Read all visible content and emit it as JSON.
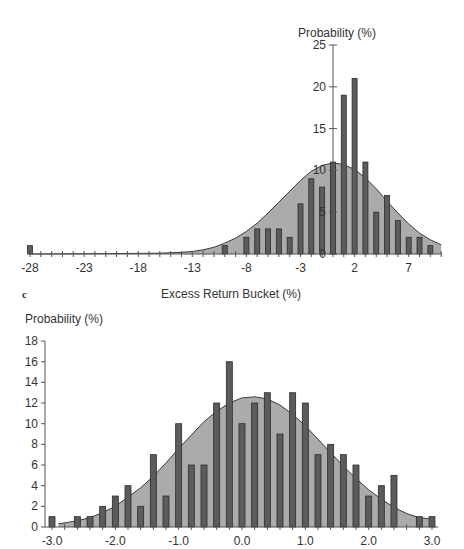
{
  "colors": {
    "background": "#ffffff",
    "bar_fill": "#5c5c5c",
    "bar_stroke": "#2a2a2a",
    "area_fill": "#ababab",
    "curve": "#3a3a3a",
    "axis": "#555555",
    "text": "#333333"
  },
  "chart_data": [
    {
      "type": "bar",
      "id": "top",
      "title": "",
      "ylabel": "Probability (%)",
      "xlabel": "Excess Return Bucket (%)",
      "ylim": [
        0,
        25
      ],
      "yticks": [
        0,
        5,
        10,
        15,
        20,
        25
      ],
      "xticks": [
        -28,
        -23,
        -18,
        -13,
        -8,
        -3,
        2,
        7
      ],
      "xlim": [
        -28,
        10
      ],
      "y_axis_at_x": 0,
      "grid": false,
      "legend": null,
      "categories": [
        -28,
        -10,
        -8,
        -7,
        -6,
        -5,
        -4,
        -3,
        -2,
        -1,
        0,
        1,
        2,
        3,
        4,
        5,
        6,
        7,
        8,
        9
      ],
      "values": [
        1,
        1,
        2,
        3,
        3,
        3,
        2,
        6,
        9,
        8,
        11,
        19,
        21,
        11,
        5,
        7,
        4,
        2,
        2,
        1
      ],
      "overlay": {
        "type": "area",
        "description": "fitted normal density",
        "x": [
          -28,
          -20,
          -16,
          -14,
          -13,
          -12,
          -11,
          -10,
          -9,
          -8,
          -7,
          -6,
          -5,
          -4,
          -3,
          -2,
          -1,
          0,
          1,
          2,
          3,
          4,
          5,
          6,
          7,
          8,
          9,
          10
        ],
        "y": [
          0,
          0.05,
          0.1,
          0.2,
          0.3,
          0.5,
          0.8,
          1.3,
          1.9,
          2.7,
          3.7,
          4.9,
          6.2,
          7.5,
          8.8,
          9.9,
          10.6,
          10.9,
          10.7,
          10.1,
          9.1,
          7.8,
          6.3,
          4.9,
          3.6,
          2.5,
          1.7,
          1.1
        ]
      }
    },
    {
      "type": "bar",
      "id": "bottom",
      "panel_label": "c",
      "title": "",
      "ylabel": "Probability (%)",
      "xlabel": "",
      "ylim": [
        0,
        18
      ],
      "yticks": [
        0,
        2,
        4,
        6,
        8,
        10,
        12,
        14,
        16,
        18
      ],
      "xticks": [
        "-3.0",
        "-2.0",
        "-1.0",
        "0.0",
        "1.0",
        "2.0",
        "3.0"
      ],
      "xlim": [
        -3.0,
        3.0
      ],
      "grid": false,
      "legend": null,
      "categories": [
        -3.0,
        -2.8,
        -2.6,
        -2.4,
        -2.2,
        -2.0,
        -1.8,
        -1.6,
        -1.4,
        -1.2,
        -1.0,
        -0.8,
        -0.6,
        -0.4,
        -0.2,
        0.0,
        0.2,
        0.4,
        0.6,
        0.8,
        1.0,
        1.2,
        1.4,
        1.6,
        1.8,
        2.0,
        2.2,
        2.4,
        2.6,
        2.8,
        3.0
      ],
      "values": [
        1,
        0,
        1,
        1,
        2,
        3,
        4,
        2,
        7,
        3,
        10,
        6,
        6,
        12,
        16,
        10,
        12,
        13,
        9,
        13,
        12,
        7,
        8,
        7,
        6,
        3,
        4,
        5,
        0,
        1,
        1
      ],
      "overlay": {
        "type": "area",
        "description": "fitted normal density",
        "x": [
          -2.9,
          -2.6,
          -2.4,
          -2.2,
          -2.0,
          -1.8,
          -1.6,
          -1.4,
          -1.2,
          -1.0,
          -0.8,
          -0.6,
          -0.4,
          -0.2,
          0.0,
          0.2,
          0.4,
          0.6,
          0.8,
          1.0,
          1.2,
          1.4,
          1.6,
          1.8,
          2.0,
          2.2,
          2.4,
          2.6,
          2.8,
          2.95
        ],
        "y": [
          0.3,
          0.6,
          0.9,
          1.4,
          2.0,
          2.9,
          3.8,
          4.9,
          6.2,
          7.6,
          8.9,
          10.2,
          11.2,
          12.0,
          12.5,
          12.6,
          12.4,
          11.8,
          10.9,
          9.8,
          8.5,
          7.2,
          5.9,
          4.7,
          3.6,
          2.7,
          1.9,
          1.3,
          0.9,
          0.8
        ]
      }
    }
  ],
  "labels": {
    "top_ylabel": "Probability (%)",
    "top_xlabel": "Excess Return Bucket (%)",
    "panel_c": "c",
    "bottom_ylabel": "Probability (%)"
  }
}
